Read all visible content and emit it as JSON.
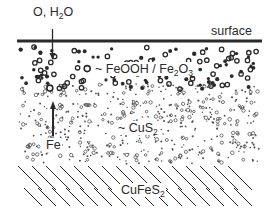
{
  "diagram": {
    "type": "layered cross-section",
    "labels": {
      "reactants": {
        "main": "O, H",
        "sub": "2",
        "tail": "O"
      },
      "surface": "surface",
      "oxide_layer": {
        "prefix": "~ FeOOH / Fe",
        "sub1": "2",
        "mid": "O",
        "sub2": "3"
      },
      "sulfide_layer": {
        "prefix": "~ CuS",
        "sub": "2"
      },
      "iron": "Fe",
      "substrate": {
        "prefix": "CuFeS",
        "sub": "2"
      }
    },
    "layers": [
      {
        "name": "surface",
        "description": "thick horizontal line"
      },
      {
        "name": "FeOOH / Fe2O3",
        "description": "bold rings and dots"
      },
      {
        "name": "CuS2",
        "description": "fine small rings and dots"
      },
      {
        "name": "CuFeS2",
        "description": "diagonal hatching"
      }
    ],
    "arrows": [
      {
        "name": "oxygen-water-ingress",
        "direction": "down"
      },
      {
        "name": "iron-outward-diffusion",
        "direction": "up"
      }
    ],
    "colors": {
      "ink": "#2a2a2a",
      "background": "#ffffff"
    }
  }
}
